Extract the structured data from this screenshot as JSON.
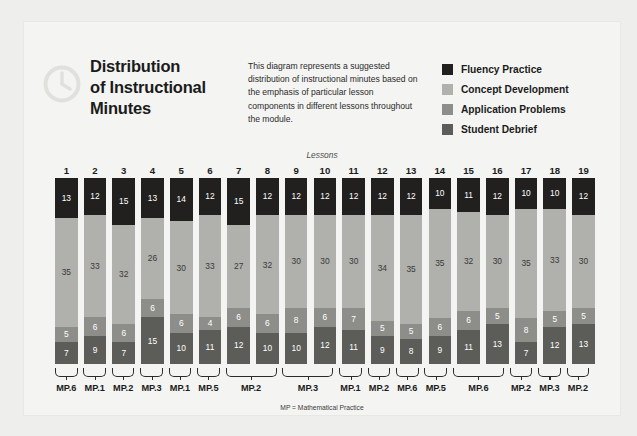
{
  "header": {
    "icon": "clock-icon",
    "title_lines": [
      "Distribution",
      "of Instructional",
      "Minutes"
    ],
    "description": "This diagram represents a suggested distribution of instructional minutes based on the emphasis of particular lesson components in different lessons throughout the module."
  },
  "legend": {
    "items": [
      {
        "label": "Fluency Practice",
        "color": "#221f1f"
      },
      {
        "label": "Concept Development",
        "color": "#b0b0ac"
      },
      {
        "label": "Application Problems",
        "color": "#8d8d89"
      },
      {
        "label": "Student Debrief",
        "color": "#5c5c59"
      }
    ]
  },
  "footnote": "MP = Mathematical Practice",
  "mp_groups": [
    {
      "label": "MP.6",
      "from": 1,
      "to": 1
    },
    {
      "label": "MP.1",
      "from": 2,
      "to": 2
    },
    {
      "label": "MP.2",
      "from": 3,
      "to": 3
    },
    {
      "label": "MP.3",
      "from": 4,
      "to": 4
    },
    {
      "label": "MP.1",
      "from": 5,
      "to": 5
    },
    {
      "label": "MP.5",
      "from": 6,
      "to": 6
    },
    {
      "label": "MP.2",
      "from": 7,
      "to": 8
    },
    {
      "label": "MP.3",
      "from": 9,
      "to": 10
    },
    {
      "label": "MP.1",
      "from": 11,
      "to": 11
    },
    {
      "label": "MP.2",
      "from": 12,
      "to": 12
    },
    {
      "label": "MP.6",
      "from": 13,
      "to": 13
    },
    {
      "label": "MP.5",
      "from": 14,
      "to": 14
    },
    {
      "label": "MP.6",
      "from": 15,
      "to": 16
    },
    {
      "label": "MP.2",
      "from": 17,
      "to": 17
    },
    {
      "label": "MP.3",
      "from": 18,
      "to": 18
    },
    {
      "label": "MP.2",
      "from": 19,
      "to": 19
    }
  ],
  "chart_data": {
    "type": "bar",
    "stacked": true,
    "title": "Distribution of Instructional Minutes",
    "xlabel": "Lessons",
    "ylabel": "",
    "ylim": [
      0,
      60
    ],
    "grid": false,
    "legend_position": "top-right",
    "categories": [
      "1",
      "2",
      "3",
      "4",
      "5",
      "6",
      "7",
      "8",
      "9",
      "10",
      "11",
      "12",
      "13",
      "14",
      "15",
      "16",
      "17",
      "18",
      "19"
    ],
    "series": [
      {
        "name": "Fluency Practice",
        "color": "#221f1f",
        "values": [
          13,
          12,
          15,
          13,
          14,
          12,
          15,
          12,
          12,
          12,
          12,
          12,
          12,
          10,
          11,
          12,
          10,
          10,
          12
        ]
      },
      {
        "name": "Concept Development",
        "color": "#b0b0ac",
        "values": [
          35,
          33,
          32,
          26,
          30,
          33,
          27,
          32,
          30,
          30,
          30,
          34,
          35,
          35,
          32,
          30,
          35,
          33,
          30
        ]
      },
      {
        "name": "Application Problems",
        "color": "#8d8d89",
        "values": [
          5,
          6,
          6,
          6,
          6,
          4,
          6,
          6,
          8,
          6,
          7,
          5,
          5,
          6,
          6,
          5,
          8,
          5,
          5
        ]
      },
      {
        "name": "Student Debrief",
        "color": "#5c5c59",
        "values": [
          7,
          9,
          7,
          15,
          10,
          11,
          12,
          10,
          10,
          12,
          11,
          9,
          8,
          9,
          11,
          13,
          7,
          12,
          13
        ]
      }
    ]
  }
}
